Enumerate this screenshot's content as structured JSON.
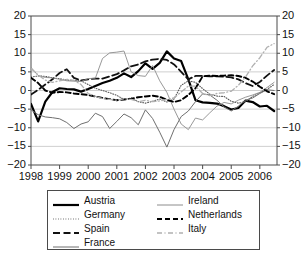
{
  "chart_data": {
    "type": "line",
    "title": "",
    "xlabel": "",
    "ylabel": "",
    "xlim": [
      1998.0,
      2006.6
    ],
    "ylim": [
      -20,
      20
    ],
    "grid": true,
    "legend_position": "bottom",
    "y_ticks": [
      20,
      15,
      10,
      5,
      0,
      -5,
      -10,
      -15,
      -20
    ],
    "y_tick_labels_left": [
      "20",
      "15",
      "10",
      "5",
      "0",
      "-5",
      "-10",
      "-15",
      "-20"
    ],
    "y_tick_labels_right": [
      "20",
      "15",
      "10",
      "5",
      "0",
      "-5",
      "-10",
      "-15",
      "-20"
    ],
    "x_ticks": [
      1998,
      1999,
      2000,
      2001,
      2002,
      2003,
      2004,
      2005,
      2006
    ],
    "x_tick_labels": [
      "1998",
      "1999",
      "2000",
      "2001",
      "2002",
      "2003",
      "2004",
      "2005",
      "2006"
    ],
    "x": [
      1998.0,
      1998.25,
      1998.5,
      1998.75,
      1999.0,
      1999.25,
      1999.5,
      1999.75,
      2000.0,
      2000.25,
      2000.5,
      2000.75,
      2001.0,
      2001.25,
      2001.5,
      2001.75,
      2002.0,
      2002.25,
      2002.5,
      2002.75,
      2003.0,
      2003.25,
      2003.5,
      2003.75,
      2004.0,
      2004.25,
      2004.5,
      2004.75,
      2005.0,
      2005.25,
      2005.5,
      2005.75,
      2006.0,
      2006.25,
      2006.5
    ],
    "series": [
      {
        "name": "Austria",
        "color": "#000000",
        "style": "solid",
        "width": 2.2,
        "values": [
          -3.6,
          -8.3,
          -3.0,
          -0.4,
          0.6,
          0.4,
          0.3,
          -0.3,
          0.4,
          1.2,
          2.0,
          2.6,
          3.4,
          4.6,
          3.6,
          5.2,
          7.3,
          5.8,
          7.4,
          10.5,
          8.6,
          7.9,
          3.0,
          -2.6,
          -3.2,
          -3.3,
          -3.5,
          -4.2,
          -5.1,
          -4.7,
          -2.7,
          -3.1,
          -4.3,
          -4.1,
          -5.5
        ]
      },
      {
        "name": "Germany",
        "color": "#555555",
        "style": "dotted",
        "width": 1.1,
        "values": [
          3.6,
          3.9,
          3.8,
          3.4,
          3.2,
          2.8,
          2.7,
          2.6,
          1.6,
          0.6,
          0.0,
          -0.6,
          -1.3,
          -2.4,
          -2.0,
          -3.0,
          -3.4,
          -2.9,
          -2.3,
          -3.1,
          -2.3,
          1.4,
          2.6,
          2.2,
          0.5,
          -1.0,
          -1.5,
          -1.6,
          -2.9,
          -3.4,
          -3.0,
          -1.6,
          -0.6,
          0.3,
          1.6
        ]
      },
      {
        "name": "Spain",
        "color": "#111111",
        "style": "dashed-long",
        "width": 1.8,
        "values": [
          -1.1,
          0.2,
          1.6,
          3.0,
          4.7,
          5.7,
          3.4,
          2.7,
          3.0,
          3.2,
          3.2,
          3.8,
          4.4,
          5.4,
          6.5,
          7.0,
          7.8,
          8.3,
          8.5,
          8.2,
          7.0,
          5.0,
          3.0,
          3.9,
          3.9,
          3.8,
          3.8,
          3.7,
          3.5,
          3.0,
          2.0,
          1.2,
          2.3,
          4.0,
          5.5
        ]
      },
      {
        "name": "France",
        "color": "#6f6f6f",
        "style": "solid",
        "width": 1.0,
        "values": [
          -5.2,
          -6.5,
          -7.1,
          -7.3,
          -7.6,
          -8.6,
          -10.2,
          -9.0,
          -8.4,
          -6.1,
          -7.0,
          -10.2,
          -8.3,
          -6.3,
          -7.3,
          -9.2,
          -5.2,
          -7.5,
          -11.2,
          -15.2,
          -10.5,
          -7.0,
          -5.5,
          -3.0,
          -0.9,
          -1.2,
          -2.6,
          -4.4,
          -5.5,
          -4.2,
          -2.6,
          -2.0,
          -0.8,
          0.2,
          0.0
        ]
      },
      {
        "name": "Ireland",
        "color": "#8c8c8c",
        "style": "solid",
        "width": 0.9,
        "values": [
          6.2,
          4.0,
          3.5,
          3.4,
          3.0,
          2.6,
          2.5,
          2.4,
          3.2,
          3.3,
          8.6,
          10.1,
          10.3,
          10.6,
          5.0,
          4.0,
          3.8,
          6.7,
          2.6,
          -0.5,
          -5.0,
          -9.0,
          -10.5,
          -7.4,
          -7.9,
          -6.0,
          -4.2,
          -3.2,
          -3.6,
          -2.6,
          -1.8,
          -1.2,
          -0.5,
          0.8,
          2.2
        ]
      },
      {
        "name": "Netherlands",
        "color": "#000000",
        "style": "dashed-med",
        "width": 1.9,
        "values": [
          3.4,
          2.0,
          0.0,
          -0.6,
          -0.4,
          -0.5,
          -0.8,
          -1.0,
          -1.2,
          -1.6,
          -2.0,
          -2.3,
          -2.6,
          -2.4,
          -2.2,
          -1.8,
          -1.6,
          -1.4,
          -1.7,
          -2.5,
          -3.1,
          -2.6,
          -1.2,
          0.6,
          3.8,
          4.0,
          3.9,
          4.0,
          4.1,
          3.9,
          3.4,
          2.4,
          1.0,
          -0.2,
          -1.0
        ]
      },
      {
        "name": "Italy",
        "color": "#b0b0b0",
        "style": "dash-dot",
        "width": 1.3,
        "values": [
          5.9,
          4.2,
          2.8,
          2.2,
          2.6,
          3.0,
          2.7,
          1.6,
          -0.8,
          -1.6,
          -2.2,
          -2.4,
          -2.6,
          -2.2,
          -2.4,
          -3.0,
          -2.6,
          -3.0,
          -2.8,
          -2.4,
          -2.0,
          -0.4,
          1.2,
          1.2,
          -0.8,
          -1.4,
          -0.8,
          -0.6,
          -0.2,
          1.4,
          3.6,
          6.6,
          8.8,
          11.6,
          12.6
        ]
      }
    ]
  },
  "legend": {
    "items": [
      {
        "label": "Austria"
      },
      {
        "label": "Ireland"
      },
      {
        "label": "Germany"
      },
      {
        "label": "Netherlands"
      },
      {
        "label": "Spain"
      },
      {
        "label": "Italy"
      },
      {
        "label": "France"
      }
    ]
  }
}
